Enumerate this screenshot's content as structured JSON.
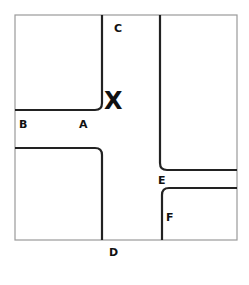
{
  "diagram": {
    "type": "intersection-map",
    "colors": {
      "frame": "#9a9a9a",
      "road_edge": "#222222",
      "label": "#111111",
      "background": "#ffffff"
    },
    "labels": {
      "A": "A",
      "B": "B",
      "C": "C",
      "D": "D",
      "E": "E",
      "F": "F",
      "X": "X"
    }
  }
}
